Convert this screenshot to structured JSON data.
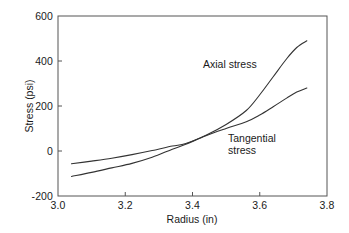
{
  "chart_data": {
    "type": "line",
    "title": "",
    "xlabel": "Radius (in)",
    "ylabel": "Stress (psi)",
    "xlim": [
      3.0,
      3.8
    ],
    "ylim": [
      -200,
      600
    ],
    "xticks": [
      "3.0",
      "3.2",
      "3.4",
      "3.6",
      "3.8"
    ],
    "xtick_values": [
      3.0,
      3.2,
      3.4,
      3.6,
      3.8
    ],
    "yticks": [
      "-200",
      "0",
      "200",
      "400",
      "600"
    ],
    "ytick_values": [
      -200,
      0,
      200,
      400,
      600
    ],
    "grid": false,
    "legend": "annotations",
    "line_color": "#333333",
    "frame_color": "#555555",
    "background": "#ffffff",
    "series": [
      {
        "name": "Axial stress",
        "annotation": "Axial stress",
        "x": [
          3.04,
          3.1,
          3.16,
          3.22,
          3.28,
          3.34,
          3.38,
          3.44,
          3.5,
          3.56,
          3.6,
          3.64,
          3.68,
          3.71,
          3.74
        ],
        "values": [
          -57,
          -45,
          -32,
          -16,
          2,
          22,
          33,
          70,
          118,
          180,
          250,
          330,
          410,
          460,
          490
        ]
      },
      {
        "name": "Tangential stress",
        "annotation": "Tangential\nstress",
        "x": [
          3.04,
          3.1,
          3.16,
          3.22,
          3.28,
          3.34,
          3.38,
          3.44,
          3.5,
          3.56,
          3.6,
          3.64,
          3.68,
          3.71,
          3.74
        ],
        "values": [
          -113,
          -95,
          -75,
          -55,
          -28,
          8,
          30,
          68,
          100,
          130,
          160,
          197,
          235,
          262,
          280
        ]
      }
    ]
  },
  "axes": {
    "xlabel": "Radius (in)",
    "ylabel": "Stress (psi)",
    "xtick_labels": [
      "3.0",
      "3.2",
      "3.4",
      "3.6",
      "3.8"
    ],
    "ytick_labels": [
      "600",
      "400",
      "200",
      "0",
      "-200"
    ]
  },
  "annotations": {
    "axial": "Axial stress",
    "tangential": "Tangential\nstress"
  }
}
